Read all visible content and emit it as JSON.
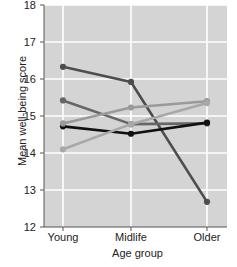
{
  "chart_data": {
    "type": "line",
    "title": "",
    "xlabel": "Age group",
    "ylabel": "Mean well-being score",
    "categories": [
      "Young",
      "Midlife",
      "Older"
    ],
    "ylim": [
      12,
      18
    ],
    "yticks": [
      12,
      13,
      14,
      15,
      16,
      17,
      18
    ],
    "grid": true,
    "legend_position": "none",
    "plot_background": "#d4d4d4",
    "gridline_color": "#ffffff",
    "series": [
      {
        "name": "series-1-declining-steep",
        "color": "#4d4d4d",
        "values": [
          16.33,
          15.92,
          12.68
        ]
      },
      {
        "name": "series-2-declining",
        "color": "#666666",
        "values": [
          15.42,
          14.78,
          14.8
        ]
      },
      {
        "name": "series-3-flat-black",
        "color": "#111111",
        "values": [
          14.72,
          14.52,
          14.82
        ]
      },
      {
        "name": "series-4-rising-gradual",
        "color": "#9a9a9a",
        "values": [
          14.8,
          15.23,
          15.4
        ]
      },
      {
        "name": "series-5-rising-steep",
        "color": "#a8a8a8",
        "values": [
          14.1,
          14.78,
          15.35
        ]
      }
    ]
  },
  "axis": {
    "y_title": "Mean well-being score",
    "x_title": "Age group",
    "y_tick_labels": [
      "18",
      "17",
      "16",
      "15",
      "14",
      "13",
      "12"
    ],
    "x_tick_labels": [
      "Young",
      "Midlife",
      "Older"
    ]
  }
}
